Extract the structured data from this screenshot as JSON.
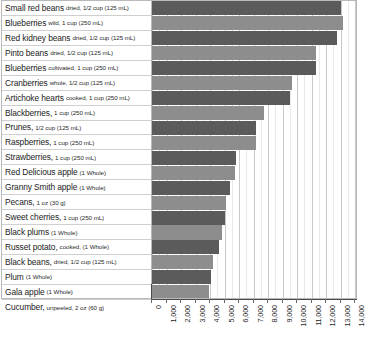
{
  "chart_data": {
    "type": "bar",
    "orientation": "horizontal",
    "title": "",
    "xlabel": "",
    "ylabel": "",
    "xlim": [
      0,
      14000
    ],
    "xtick_step": 1000,
    "grid": true,
    "legend": false,
    "xticks": [
      "0",
      "1,000",
      "2,000",
      "3,000",
      "4,000",
      "5,000",
      "6,000",
      "7,000",
      "8,000",
      "9,000",
      "10,000",
      "11,000",
      "12,000",
      "13,000",
      "14,000"
    ],
    "bar_colors": {
      "dark": "#5b5b5b",
      "light": "#8d8d8d"
    },
    "categories": [
      "Small red beans, dried, 1/2 cup (125 mL)",
      "Blueberries, wild, 1 cup (250 mL)",
      "Red kidney beans, dried, 1/2 cup (125 mL)",
      "Pinto beans, dried, 1/2 cup (125 mL)",
      "Blueberries, cultivated, 1 cup (250 mL)",
      "Cranberries, whole, 1/2 cup (125 mL)",
      "Artichoke hearts, cooked, 1 cup (250 mL)",
      "Blackberries, 1 cup (250 mL)",
      "Prunes, 1/2 cup (125 mL)",
      "Raspberries, 1 cup (250 mL)",
      "Strawberries, 1 cup (250 mL)",
      "Red Delicious apple (1 Whole)",
      "Granny Smith apple (1 Whole)",
      "Pecans, 1 oz (30 g)",
      "Sweet cherries, 1 cup (250 mL)",
      "Black plums (1 Whole)",
      "Russet potato, cooked, (1 Whole)",
      "Black beans, dried, 1/2 cup (125 mL)",
      "Plum (1 Whole)",
      "Gala apple (1 Whole)",
      "Cucumber, unpeeled, 2 oz (60 g)"
    ],
    "values": [
      13040,
      13180,
      12760,
      11300,
      11300,
      9650,
      9550,
      7700,
      7150,
      7150,
      5800,
      5750,
      5400,
      5100,
      5000,
      4850,
      4650,
      4200,
      4050,
      3950,
      60
    ],
    "rows": [
      {
        "name": "Small red beans",
        "qualifier": "dried, 1/2 cup (125 mL)",
        "value": 13040,
        "shade": "dark"
      },
      {
        "name": "Blueberries",
        "qualifier": "wild, 1 cup (250 mL)",
        "value": 13180,
        "shade": "light"
      },
      {
        "name": "Red kidney beans",
        "qualifier": "dried, 1/2 cup (125 mL)",
        "value": 12760,
        "shade": "dark"
      },
      {
        "name": "Pinto beans",
        "qualifier": "dried, 1/2 cup (125 mL)",
        "value": 11300,
        "shade": "light"
      },
      {
        "name": "Blueberries",
        "qualifier": "cultivated, 1 cup (250 mL)",
        "value": 11300,
        "shade": "dark"
      },
      {
        "name": "Cranberries",
        "qualifier": "whole, 1/2 cup (125 mL)",
        "value": 9650,
        "shade": "light"
      },
      {
        "name": "Artichoke hearts",
        "qualifier": "cooked, 1 cup (250 mL)",
        "value": 9550,
        "shade": "dark"
      },
      {
        "name": "Blackberries,",
        "qualifier": "1 cup (250 mL)",
        "value": 7700,
        "shade": "light"
      },
      {
        "name": "Prunes,",
        "qualifier": "1/2 cup (125 mL)",
        "value": 7150,
        "shade": "dark"
      },
      {
        "name": "Raspberries,",
        "qualifier": "1 cup (250 mL)",
        "value": 7150,
        "shade": "light"
      },
      {
        "name": "Strawberries,",
        "qualifier": "1 cup (250 mL)",
        "value": 5800,
        "shade": "dark"
      },
      {
        "name": "Red Delicious apple",
        "qualifier": "(1 Whole)",
        "value": 5750,
        "shade": "light"
      },
      {
        "name": "Granny Smith apple",
        "qualifier": "(1 Whole)",
        "value": 5400,
        "shade": "dark"
      },
      {
        "name": "Pecans,",
        "qualifier": "1 oz (30 g)",
        "value": 5100,
        "shade": "light"
      },
      {
        "name": "Sweet cherries,",
        "qualifier": "1 cup (250 mL)",
        "value": 5000,
        "shade": "dark"
      },
      {
        "name": "Black plums",
        "qualifier": "(1 Whole)",
        "value": 4850,
        "shade": "light"
      },
      {
        "name": "Russet potato,",
        "qualifier": "cooked, (1 Whole)",
        "value": 4650,
        "shade": "dark"
      },
      {
        "name": "Black beans,",
        "qualifier": "dried, 1/2 cup (125 mL)",
        "value": 4200,
        "shade": "light"
      },
      {
        "name": "Plum",
        "qualifier": "(1 Whole)",
        "value": 4050,
        "shade": "dark"
      },
      {
        "name": "Gala apple",
        "qualifier": "(1 Whole)",
        "value": 3950,
        "shade": "light"
      },
      {
        "name": "Cucumber,",
        "qualifier": "unpeeled, 2 oz (60 g)",
        "value": 60,
        "shade": "dark"
      }
    ]
  }
}
